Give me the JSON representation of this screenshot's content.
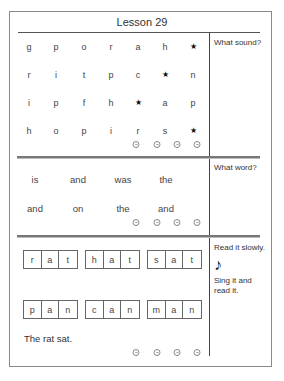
{
  "title": "Lesson 29",
  "sections": {
    "sounds": {
      "prompt": "What sound?",
      "rows": [
        [
          "g",
          "p",
          "o",
          "r",
          "a",
          "h",
          "★"
        ],
        [
          "r",
          "i",
          "t",
          "p",
          "c",
          "★",
          "n"
        ],
        [
          "i",
          "p",
          "f",
          "h",
          "★",
          "a",
          "p"
        ],
        [
          "h",
          "o",
          "p",
          "i",
          "r",
          "s",
          "★"
        ]
      ],
      "rating_icons": [
        "smiley-face",
        "smiley-face",
        "smiley-face",
        "smiley-face"
      ]
    },
    "words": {
      "prompt": "What word?",
      "rows": [
        [
          "is",
          "and",
          "was",
          "the"
        ],
        [
          "and",
          "on",
          "the",
          "and"
        ]
      ],
      "rating_icons": [
        "smiley-face",
        "smiley-face",
        "smiley-face",
        "smiley-face"
      ]
    },
    "reading": {
      "prompt": "Read it slowly.",
      "music_note": "♪",
      "prompt2": "Sing it and read it.",
      "word_rows": [
        [
          [
            "r",
            "a",
            "t"
          ],
          [
            "h",
            "a",
            "t"
          ],
          [
            "s",
            "a",
            "t"
          ]
        ],
        [
          [
            "p",
            "a",
            "n"
          ],
          [
            "c",
            "a",
            "n"
          ],
          [
            "m",
            "a",
            "n"
          ]
        ]
      ],
      "sentence": "The rat sat.",
      "rating_icons": [
        "smiley-face",
        "smiley-face",
        "smiley-face",
        "smiley-face"
      ]
    }
  }
}
